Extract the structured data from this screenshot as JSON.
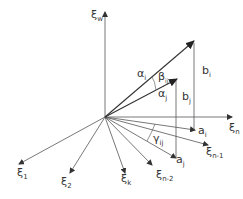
{
  "diagram": {
    "origin": [
      105,
      117
    ],
    "axes": {
      "xi_w": {
        "label": "ξ",
        "sub": "w"
      },
      "xi_n": {
        "label": "ξ",
        "sub": "n"
      },
      "xi_1": {
        "label": "ξ",
        "sub": "1"
      },
      "xi_2": {
        "label": "ξ",
        "sub": "2"
      },
      "xi_k": {
        "label": "ξ",
        "sub": "k"
      },
      "xi_n2": {
        "label": "ξ",
        "sub": "n-2"
      },
      "xi_n1": {
        "label": "ξ",
        "sub": "n-1"
      }
    },
    "vectors": {
      "alpha_i": {
        "label": "α",
        "sub": "i"
      },
      "alpha_j": {
        "label": "α",
        "sub": "j"
      },
      "beta_ij": {
        "label": "β",
        "sub": "ij"
      },
      "gamma_ij": {
        "label": "γ",
        "sub": "ij"
      },
      "a_i": {
        "label": "a",
        "sub": "i"
      },
      "a_j": {
        "label": "a",
        "sub": "j"
      },
      "b_i": {
        "label": "b",
        "sub": "i"
      },
      "b_j": {
        "label": "b",
        "sub": "j"
      }
    }
  }
}
